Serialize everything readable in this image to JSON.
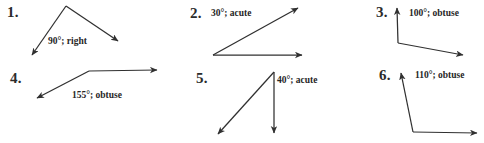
{
  "page": {
    "background_color": "#ffffff",
    "ink_color": "#303030",
    "text_color": "#262626"
  },
  "problems": [
    {
      "number": "1.",
      "annotation": "90°; right",
      "measure": "90°",
      "classification": "right",
      "number_pos": {
        "x": 7,
        "y": 5
      },
      "annotation_pos": {
        "x": 48,
        "y": 37
      },
      "figure": {
        "vertex": {
          "x": 66,
          "y": 6
        },
        "rays": [
          {
            "name": "ray-down-left",
            "to": {
              "x": 30,
              "y": 58
            }
          },
          {
            "name": "ray-down-right",
            "to": {
              "x": 121,
              "y": 43
            }
          }
        ]
      }
    },
    {
      "number": "2.",
      "annotation": "30°; acute",
      "measure": "30°",
      "classification": "acute",
      "number_pos": {
        "x": 190,
        "y": 6
      },
      "annotation_pos": {
        "x": 211,
        "y": 9
      },
      "figure": {
        "vertex": {
          "x": 213,
          "y": 55
        },
        "rays": [
          {
            "name": "ray-right",
            "to": {
              "x": 306,
              "y": 55
            }
          },
          {
            "name": "ray-up-right",
            "to": {
              "x": 301,
              "y": 6
            }
          }
        ]
      }
    },
    {
      "number": "3.",
      "annotation": "100°; obtuse",
      "measure": "100°",
      "classification": "obtuse",
      "number_pos": {
        "x": 376,
        "y": 5
      },
      "annotation_pos": {
        "x": 409,
        "y": 9
      },
      "figure": {
        "vertex": {
          "x": 398,
          "y": 43
        },
        "rays": [
          {
            "name": "ray-up",
            "to": {
              "x": 397,
              "y": 5
            }
          },
          {
            "name": "ray-right-down",
            "to": {
              "x": 467,
              "y": 57
            }
          }
        ]
      }
    },
    {
      "number": "4.",
      "annotation": "155°; obtuse",
      "measure": "155°",
      "classification": "obtuse",
      "number_pos": {
        "x": 10,
        "y": 71
      },
      "annotation_pos": {
        "x": 72,
        "y": 91
      },
      "figure": {
        "vertex": {
          "x": 89,
          "y": 71
        },
        "rays": [
          {
            "name": "ray-right",
            "to": {
              "x": 161,
              "y": 70
            }
          },
          {
            "name": "ray-down-left",
            "to": {
              "x": 33,
              "y": 100
            }
          }
        ]
      }
    },
    {
      "number": "5.",
      "annotation": "40°; acute",
      "measure": "40°",
      "classification": "acute",
      "number_pos": {
        "x": 196,
        "y": 71
      },
      "annotation_pos": {
        "x": 277,
        "y": 76
      },
      "figure": {
        "vertex": {
          "x": 274,
          "y": 72
        },
        "rays": [
          {
            "name": "ray-down",
            "to": {
              "x": 274,
              "y": 137
            }
          },
          {
            "name": "ray-down-left",
            "to": {
              "x": 214,
              "y": 137
            }
          }
        ]
      }
    },
    {
      "number": "6.",
      "annotation": "110°; obtuse",
      "measure": "110°",
      "classification": "obtuse",
      "number_pos": {
        "x": 379,
        "y": 68
      },
      "annotation_pos": {
        "x": 415,
        "y": 71
      },
      "figure": {
        "vertex": {
          "x": 413,
          "y": 132
        },
        "rays": [
          {
            "name": "ray-up-left",
            "to": {
              "x": 400,
              "y": 70
            }
          },
          {
            "name": "ray-right",
            "to": {
              "x": 481,
              "y": 133
            }
          }
        ]
      }
    }
  ]
}
